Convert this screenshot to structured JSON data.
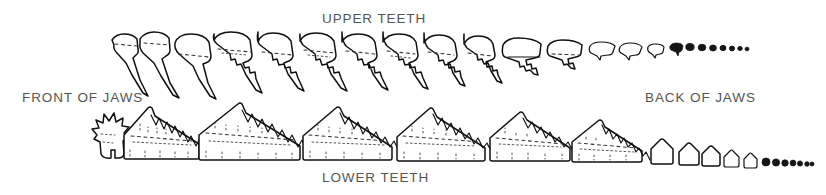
{
  "figure": {
    "background_color": "#ffffff",
    "ink_color": "#111111",
    "label_color": "#555555"
  },
  "labels": {
    "upper_teeth": "UPPER TEETH",
    "lower_teeth": "LOWER TEETH",
    "front_of_jaws": "FRONT OF JAWS",
    "back_of_jaws": "BACK OF JAWS"
  },
  "rows": {
    "upper": {
      "name": "upper-tooth-row",
      "label": "UPPER TEETH",
      "large_tooth_count": 12,
      "tiny_tooth_count": 7,
      "description": "Row of upper teeth decreasing in size from front (left) to back (right), each with a broad crown and a tapering root; the rearmost teeth reduce to small dots."
    },
    "lower": {
      "name": "lower-tooth-row",
      "label": "LOWER TEETH",
      "large_tooth_count": 7,
      "tiny_tooth_count": 10,
      "description": "Row of lower teeth with tall serrated crowns and broad rectangular bases, decreasing in size toward the back of the jaw; rearmost teeth reduce to small rounded nubs."
    }
  },
  "orientation": {
    "front": "FRONT OF JAWS",
    "back": "BACK OF JAWS",
    "front_side": "left",
    "back_side": "right"
  }
}
